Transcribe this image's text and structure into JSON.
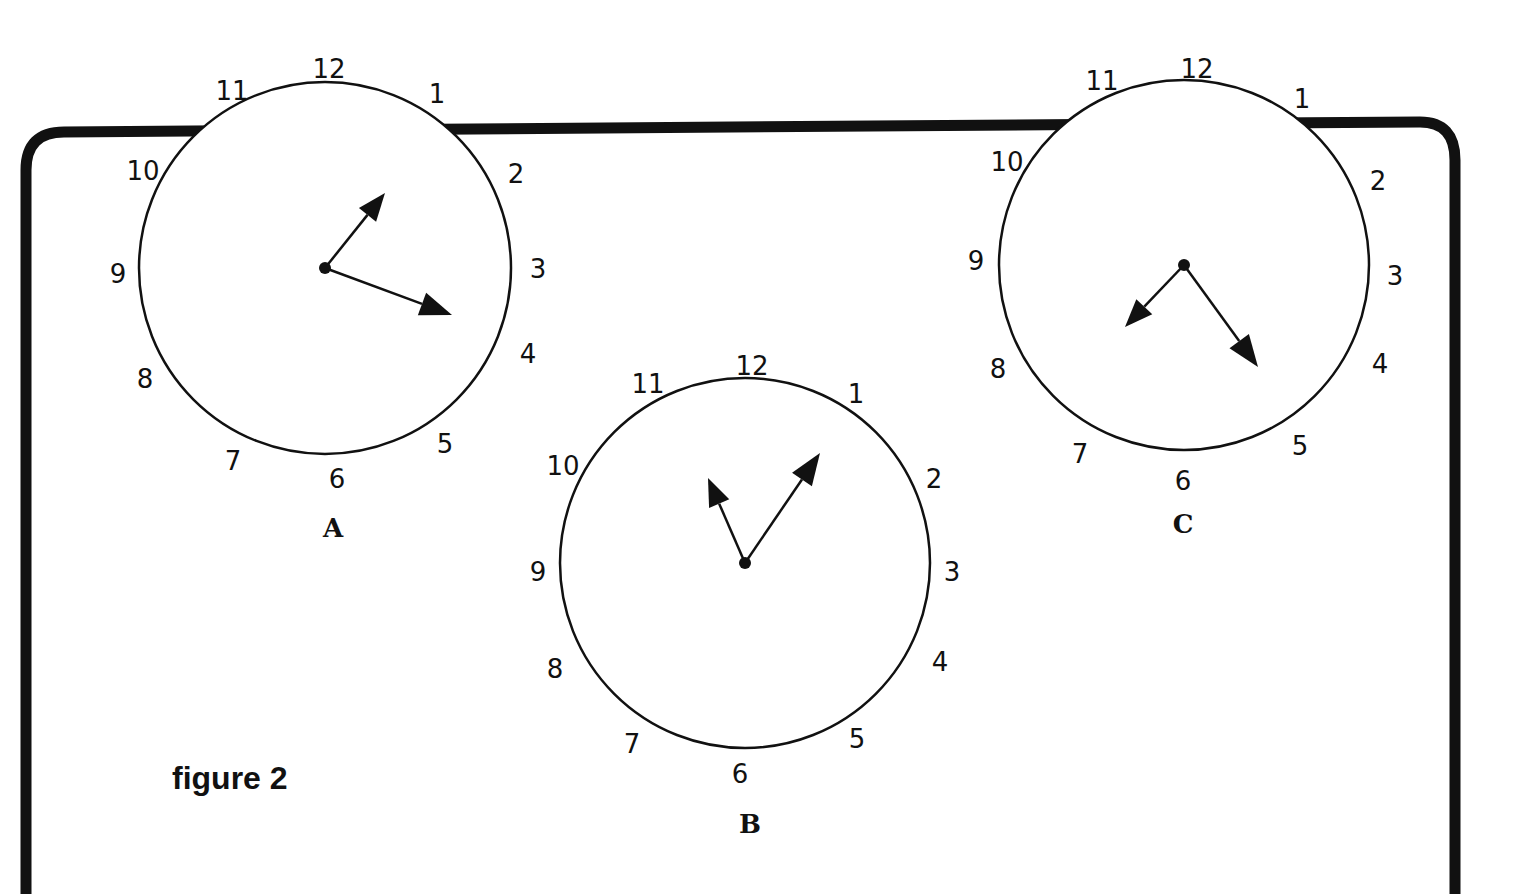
{
  "figure": {
    "caption": "figure 2",
    "frame_color": "#111111",
    "ink_color": "#111111"
  },
  "clocks": [
    {
      "label": "A",
      "center": [
        325,
        268
      ],
      "radius": 186,
      "hands": {
        "short": [
          385,
          193
        ],
        "long": [
          452,
          315
        ]
      },
      "numerals": {
        "12": [
          329,
          70
        ],
        "1": [
          437,
          95
        ],
        "2": [
          516,
          175
        ],
        "3": [
          538,
          270
        ],
        "4": [
          528,
          355
        ],
        "5": [
          445,
          445
        ],
        "6": [
          337,
          480
        ],
        "7": [
          233,
          462
        ],
        "8": [
          145,
          380
        ],
        "9": [
          118,
          275
        ],
        "10": [
          143,
          172
        ],
        "11": [
          232,
          92
        ]
      },
      "label_pos": [
        333,
        530
      ]
    },
    {
      "label": "B",
      "center": [
        745,
        563
      ],
      "radius": 185,
      "hands": {
        "short": [
          708,
          478
        ],
        "long": [
          820,
          453
        ]
      },
      "numerals": {
        "12": [
          752,
          367
        ],
        "1": [
          856,
          395
        ],
        "2": [
          934,
          480
        ],
        "3": [
          952,
          573
        ],
        "4": [
          940,
          663
        ],
        "5": [
          857,
          740
        ],
        "6": [
          740,
          775
        ],
        "7": [
          632,
          745
        ],
        "8": [
          555,
          670
        ],
        "9": [
          538,
          573
        ],
        "10": [
          563,
          467
        ],
        "11": [
          648,
          385
        ]
      },
      "label_pos": [
        750,
        826
      ]
    },
    {
      "label": "C",
      "center": [
        1184,
        265
      ],
      "radius": 185,
      "hands": {
        "short": [
          1125,
          327
        ],
        "long": [
          1258,
          367
        ]
      },
      "numerals": {
        "12": [
          1197,
          70
        ],
        "1": [
          1302,
          100
        ],
        "2": [
          1378,
          182
        ],
        "3": [
          1395,
          277
        ],
        "4": [
          1380,
          365
        ],
        "5": [
          1300,
          447
        ],
        "6": [
          1183,
          482
        ],
        "7": [
          1080,
          455
        ],
        "8": [
          998,
          370
        ],
        "9": [
          976,
          262
        ],
        "10": [
          1007,
          163
        ],
        "11": [
          1102,
          82
        ]
      },
      "label_pos": [
        1183,
        526
      ]
    }
  ]
}
